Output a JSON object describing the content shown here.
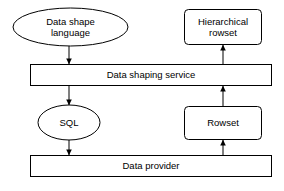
{
  "diagram": {
    "background_color": "#ffffff",
    "stroke_color": "#000000",
    "text_color": "#000000",
    "nodes": [
      {
        "id": "data-shape-language",
        "label": "Data shape\nlanguage",
        "shape": "ellipse",
        "x": 13,
        "y": 8,
        "w": 115,
        "h": 38
      },
      {
        "id": "hierarchical-rowset",
        "label": "Hierarchical\nrowset",
        "shape": "rounded-rect",
        "x": 184,
        "y": 9,
        "w": 78,
        "h": 36
      },
      {
        "id": "data-shaping-service",
        "label": "Data shaping service",
        "shape": "rect",
        "x": 30,
        "y": 64,
        "w": 242,
        "h": 22
      },
      {
        "id": "sql",
        "label": "SQL",
        "shape": "ellipse",
        "x": 38,
        "y": 105,
        "w": 62,
        "h": 35
      },
      {
        "id": "rowset",
        "label": "Rowset",
        "shape": "rounded-rect",
        "x": 184,
        "y": 106,
        "w": 78,
        "h": 34
      },
      {
        "id": "data-provider",
        "label": "Data provider",
        "shape": "rect",
        "x": 30,
        "y": 155,
        "w": 242,
        "h": 22
      }
    ],
    "edges": [
      {
        "id": "edge-language-to-service",
        "from": "data-shape-language",
        "to": "data-shaping-service",
        "direction": "down",
        "x": 69,
        "y1": 46,
        "y2": 64
      },
      {
        "id": "edge-rowset-hier-to-top",
        "from": "data-shaping-service",
        "to": "hierarchical-rowset",
        "direction": "up",
        "x": 223,
        "y1": 64,
        "y2": 45
      },
      {
        "id": "edge-service-to-sql",
        "from": "data-shaping-service",
        "to": "sql",
        "direction": "down",
        "x": 69,
        "y1": 86,
        "y2": 105
      },
      {
        "id": "edge-rowset-to-service",
        "from": "rowset",
        "to": "data-shaping-service",
        "direction": "up",
        "x": 223,
        "y1": 106,
        "y2": 86
      },
      {
        "id": "edge-sql-to-provider",
        "from": "sql",
        "to": "data-provider",
        "direction": "down",
        "x": 69,
        "y1": 140,
        "y2": 155
      },
      {
        "id": "edge-provider-to-rowset",
        "from": "data-provider",
        "to": "rowset",
        "direction": "up",
        "x": 223,
        "y1": 155,
        "y2": 140
      }
    ]
  }
}
